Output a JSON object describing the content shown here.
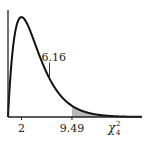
{
  "chart_data": {
    "type": "area",
    "title": "",
    "distribution": "chi-square",
    "degrees_of_freedom": 4,
    "xlabel": "χ²₄",
    "xlabel_base": "χ",
    "xlabel_sup": "2",
    "xlabel_sub": "4",
    "ylabel": "",
    "xlim": [
      0,
      20
    ],
    "ylim": [
      0,
      0.19
    ],
    "grid": false,
    "x_ticks": [
      {
        "value": 2,
        "label": "2"
      },
      {
        "value": 9.49,
        "label": "9.49"
      }
    ],
    "shaded_region": {
      "from": 9.49,
      "to": 20,
      "color": "#b8b8b8"
    },
    "annotation": {
      "value": 6.16,
      "label": "6.16"
    },
    "curve_color": "#111111"
  }
}
